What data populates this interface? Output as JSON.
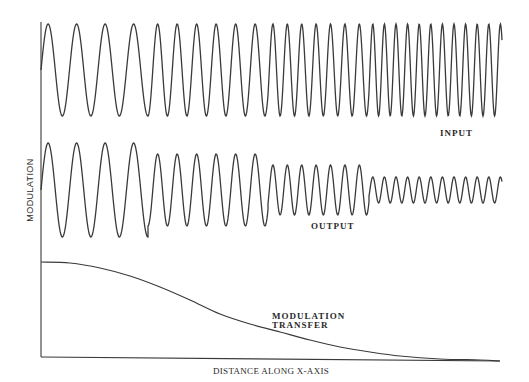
{
  "figure": {
    "y_axis_label": "MODULATION",
    "x_axis_label": "DISTANCE ALONG X-AXIS",
    "input_label": "INPUT",
    "output_label": "OUTPUT",
    "mtf_label_line1": "MODULATION",
    "mtf_label_line2": "TRANSFER",
    "stroke_color": "#3a3a3a",
    "background": "#ffffff"
  },
  "chart_data": {
    "type": "line",
    "title": "",
    "xlabel": "DISTANCE ALONG X-AXIS",
    "ylabel": "MODULATION",
    "series": [
      {
        "name": "INPUT",
        "center_y": 70,
        "segments": [
          {
            "x_start": 41,
            "x_end": 148,
            "period": 28.5,
            "amplitude": 46
          },
          {
            "x_start": 148,
            "x_end": 268,
            "period": 19.5,
            "amplitude": 46
          },
          {
            "x_start": 268,
            "x_end": 369,
            "period": 14.4,
            "amplitude": 46
          },
          {
            "x_start": 369,
            "x_end": 502,
            "period": 11.6,
            "amplitude": 46
          }
        ]
      },
      {
        "name": "OUTPUT",
        "center_y": 190,
        "segments": [
          {
            "x_start": 41,
            "x_end": 148,
            "period": 28.5,
            "amplitude": 47
          },
          {
            "x_start": 148,
            "x_end": 268,
            "period": 19.5,
            "amplitude": 36
          },
          {
            "x_start": 268,
            "x_end": 369,
            "period": 14.4,
            "amplitude": 25
          },
          {
            "x_start": 369,
            "x_end": 502,
            "period": 11.6,
            "amplitude": 13
          }
        ]
      },
      {
        "name": "MODULATION TRANSFER",
        "points": [
          [
            41,
            262
          ],
          [
            70,
            263
          ],
          [
            100,
            268
          ],
          [
            130,
            276
          ],
          [
            160,
            287
          ],
          [
            190,
            300
          ],
          [
            220,
            314
          ],
          [
            250,
            324
          ],
          [
            280,
            332
          ],
          [
            310,
            340
          ],
          [
            340,
            347
          ],
          [
            370,
            352
          ],
          [
            400,
            356
          ],
          [
            440,
            359
          ],
          [
            480,
            360
          ],
          [
            500,
            361
          ]
        ]
      }
    ],
    "axes": {
      "y_axis": {
        "x": 41,
        "y_top": 22,
        "y_bottom": 357
      },
      "x_axis": {
        "x_start": 41,
        "y_start": 357,
        "x_end": 500,
        "y_end": 361
      }
    },
    "grid": false,
    "legend": "none (inline labels)"
  }
}
